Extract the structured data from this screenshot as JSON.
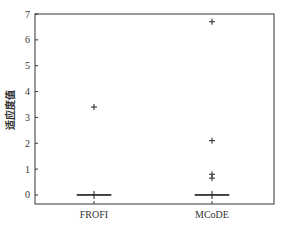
{
  "chart_data": {
    "type": "box",
    "title": "",
    "xlabel": "",
    "ylabel": "适应度值",
    "ylim": [
      -0.35,
      7
    ],
    "yticks": [
      0,
      1,
      2,
      3,
      4,
      5,
      6,
      7
    ],
    "grid": false,
    "legend": null,
    "categories": [
      "FROFI",
      "MCoDE"
    ],
    "series": [
      {
        "name": "FROFI",
        "median": 0,
        "q1": 0,
        "q3": 0,
        "whisker_low": 0,
        "whisker_high": 0,
        "outliers": [
          3.4
        ]
      },
      {
        "name": "MCoDE",
        "median": 0,
        "q1": 0,
        "q3": 0,
        "whisker_low": 0,
        "whisker_high": 0,
        "outliers": [
          6.7,
          2.1,
          0.8,
          0.65
        ]
      }
    ]
  },
  "colors": {
    "axis": "#333333",
    "marker": "#222222",
    "median": "#222222"
  }
}
